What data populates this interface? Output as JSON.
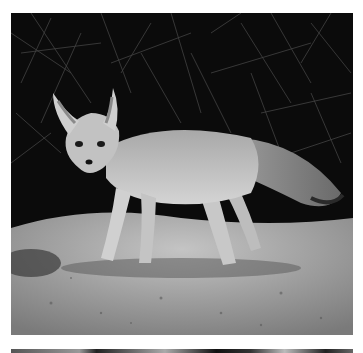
{
  "image": {
    "subject": "kit fox standing on sandy ground at night",
    "style": "grayscale photograph",
    "background": "dark brush and branches",
    "foreground": "pebbly sand"
  },
  "colors": {
    "page_bg": "#ffffff",
    "background_dark": "#0a0a0a",
    "fur": "#b8b8b8",
    "ground": "#a8a8a8"
  }
}
